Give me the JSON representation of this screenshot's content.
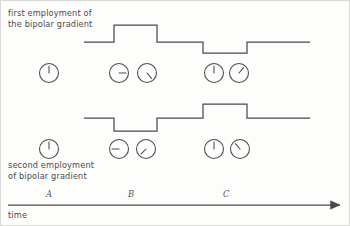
{
  "figure": {
    "background": "#fdfdfc",
    "stroke_color": "#4a4a4a",
    "text_color": "#4a4a4a",
    "label_color": "#555555"
  },
  "captions": {
    "top": "first employment of\nthe bipolar gradient",
    "bottom": "second employment\nof bipolar gradient",
    "axis": "time"
  },
  "tick_labels": [
    {
      "text": "A",
      "x": 49
    },
    {
      "text": "B",
      "x": 131
    },
    {
      "text": "C",
      "x": 226
    }
  ],
  "waveforms": [
    {
      "name": "first-bipolar-gradient",
      "baseline_y": 42,
      "high_y": 25,
      "low_y": 53,
      "path": "M 84,42 L 114,42 L 114,25 L 157,25 L 157,42 L 203,42 L 203,53 L 247,53 L 247,42 L 310,42"
    },
    {
      "name": "second-bipolar-gradient",
      "baseline_y": 118,
      "high_y": 104,
      "low_y": 131,
      "path": "M 84,118 L 114,118 L 114,131 L 157,131 L 157,118 L 203,118 L 203,104 L 247,104 L 247,118 L 310,118"
    }
  ],
  "clock_rows": [
    {
      "name": "top-clock-row",
      "center_y": 73,
      "clocks": [
        {
          "id": "A1",
          "cx": 49,
          "r": 9.5,
          "angle_deg": 0,
          "hand_len": 7.0,
          "group": "A"
        },
        {
          "id": "B1",
          "cx": 119,
          "r": 9.5,
          "angle_deg": 90,
          "hand_len": 7.0,
          "group": "B"
        },
        {
          "id": "B2",
          "cx": 147,
          "r": 9.5,
          "angle_deg": 140,
          "hand_len": 7.0,
          "group": "B"
        },
        {
          "id": "C1",
          "cx": 214,
          "r": 9.5,
          "angle_deg": 0,
          "hand_len": 7.0,
          "group": "C"
        },
        {
          "id": "C2",
          "cx": 239,
          "r": 9.5,
          "angle_deg": 40,
          "hand_len": 7.0,
          "group": "C"
        }
      ]
    },
    {
      "name": "bottom-clock-row",
      "center_y": 149,
      "clocks": [
        {
          "id": "A1b",
          "cx": 49,
          "r": 9.5,
          "angle_deg": 0,
          "hand_len": 7.0,
          "group": "A"
        },
        {
          "id": "B1b",
          "cx": 119,
          "r": 9.5,
          "angle_deg": 270,
          "hand_len": 7.0,
          "group": "B"
        },
        {
          "id": "B2b",
          "cx": 146,
          "r": 9.5,
          "angle_deg": 225,
          "hand_len": 7.0,
          "group": "B"
        },
        {
          "id": "C1b",
          "cx": 214,
          "r": 9.5,
          "angle_deg": 0,
          "hand_len": 7.0,
          "group": "C"
        },
        {
          "id": "C2b",
          "cx": 240,
          "r": 9.5,
          "angle_deg": 320,
          "hand_len": 7.0,
          "group": "C"
        }
      ]
    }
  ],
  "time_axis": {
    "y": 205,
    "x_start": 8,
    "x_end": 340,
    "arrow_head_size": 5
  },
  "border": {
    "color": "#d8d8d6",
    "width": 1
  }
}
